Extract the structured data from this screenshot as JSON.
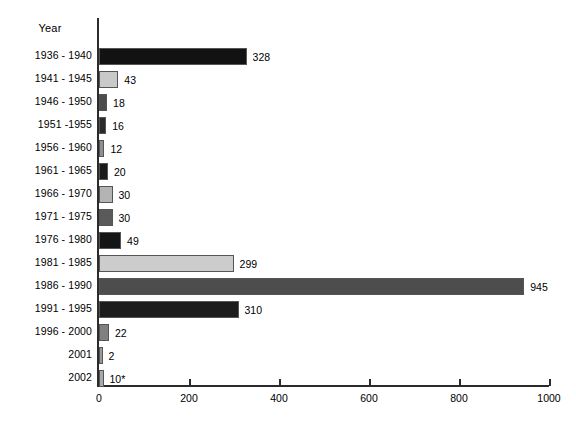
{
  "chart_data": {
    "type": "bar",
    "orientation": "horizontal",
    "title": "",
    "xlabel": "",
    "ylabel": "Year",
    "xlim": [
      0,
      1000
    ],
    "xticks": [
      0,
      200,
      400,
      600,
      800,
      1000
    ],
    "xtick_labels": [
      "0",
      "200",
      "400",
      "600",
      "800",
      "1000"
    ],
    "grid": false,
    "legend": null,
    "categories": [
      "1936 - 1940",
      "1941 - 1945",
      "1946 - 1950",
      "1951 -1955",
      "1956 - 1960",
      "1961 - 1965",
      "1966 - 1970",
      "1971 - 1975",
      "1976 - 1980",
      "1981 - 1985",
      "1986 - 1990",
      "1991 - 1995",
      "1996 - 2000",
      "2001",
      "2002"
    ],
    "values": [
      328,
      43,
      18,
      16,
      12,
      20,
      30,
      30,
      49,
      299,
      945,
      310,
      22,
      2,
      10
    ],
    "value_labels": [
      "328",
      "43",
      "18",
      "16",
      "12",
      "20",
      "30",
      "30",
      "49",
      "299",
      "945",
      "310",
      "22",
      "2",
      "10*"
    ],
    "bar_colors": [
      "#121212",
      "#c9c9c9",
      "#4b4b4b",
      "#2a2a2a",
      "#8f8f8f",
      "#1a1a1a",
      "#b4b4b4",
      "#5a5a5a",
      "#151515",
      "#cccccc",
      "#4d4d4d",
      "#1c1c1c",
      "#808080",
      "#9a9a9a",
      "#a8a8a8"
    ]
  },
  "footnote": "10*"
}
